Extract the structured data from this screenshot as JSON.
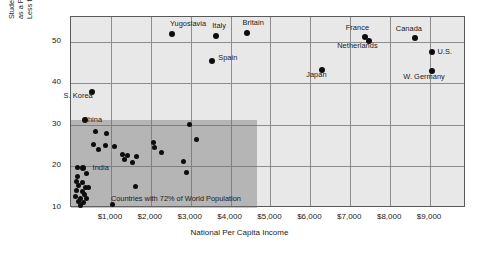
{
  "chart_data": {
    "type": "scatter",
    "title": "",
    "xlabel": "National Per Capita Income",
    "ylabel": "Students Enrolled in Secondary School as a Percentage of All Children Less that 15 Years Old",
    "ylabel_lines": [
      "Students Enrolled in Secondary School",
      "as a Percentage of All Children",
      "Less that 15 Years Old"
    ],
    "xlim": [
      0,
      9900
    ],
    "ylim": [
      10,
      56
    ],
    "xticks": [
      1000,
      2000,
      3000,
      4000,
      5000,
      6000,
      7000,
      8000,
      9000
    ],
    "xtick_labels": [
      "$1,000",
      "$2,000",
      "$3,000",
      "$4,000",
      "$5,000",
      "$6,000",
      "$7,000",
      "$8,000",
      "$9,000"
    ],
    "yticks": [
      10,
      20,
      30,
      40,
      50
    ],
    "ytick_labels": [
      "10",
      "20",
      "30",
      "40",
      "50"
    ],
    "grid": true,
    "legend": "none",
    "plot_bgcolor": "#e8e8e8",
    "point_color": "#0d0d0d",
    "shade_color": "rgba(110,110,110,0.42)",
    "annotations": [
      {
        "text": "Countries with 72% of World Population",
        "x": 1000,
        "y": 12.3
      }
    ],
    "shaded_region": {
      "label": "Countries with 72% of World Population",
      "x_range": [
        0,
        4650
      ],
      "y_range": [
        10,
        31.3
      ]
    },
    "labeled_points": [
      {
        "name": "Yugoslavia",
        "x": 2530,
        "y": 51.9,
        "label_dx": -2,
        "label_dy": -11
      },
      {
        "name": "Italy",
        "x": 3640,
        "y": 51.4,
        "label_dx": -4,
        "label_dy": -11
      },
      {
        "name": "Britain",
        "x": 4400,
        "y": 52.1,
        "label_dx": -4,
        "label_dy": -11
      },
      {
        "name": "Spain",
        "x": 3540,
        "y": 45.4,
        "label_dx": 6,
        "label_dy": -4
      },
      {
        "name": "S. Korea",
        "x": 530,
        "y": 38.0,
        "label_dx": -20,
        "label_dy": 3
      },
      {
        "name": "Japan",
        "x": 6300,
        "y": 43.2,
        "label_dx": -12,
        "label_dy": 4
      },
      {
        "name": "France",
        "x": 7380,
        "y": 51.3,
        "label_dx": -14,
        "label_dy": -10
      },
      {
        "name": "Netherlands",
        "x": 7480,
        "y": 50.2,
        "label_dx": -18,
        "label_dy": 4
      },
      {
        "name": "Canada",
        "x": 8620,
        "y": 51.0,
        "label_dx": -12,
        "label_dy": -10
      },
      {
        "name": "U.S.",
        "x": 9060,
        "y": 47.6,
        "label_dx": 5,
        "label_dy": -1
      },
      {
        "name": "W. Germany",
        "x": 9050,
        "y": 43.0,
        "label_dx": -14,
        "label_dy": 5
      },
      {
        "name": "China",
        "x": 340,
        "y": 31.3,
        "label_dx": -2,
        "label_dy": -1
      },
      {
        "name": "India",
        "x": 290,
        "y": 19.6,
        "label_dx": 10,
        "label_dy": -1
      }
    ],
    "unlabeled_points": [
      {
        "x": 620,
        "y": 28.4
      },
      {
        "x": 900,
        "y": 28.0
      },
      {
        "x": 560,
        "y": 25.2
      },
      {
        "x": 700,
        "y": 24.0
      },
      {
        "x": 860,
        "y": 25.0
      },
      {
        "x": 1080,
        "y": 24.9
      },
      {
        "x": 1290,
        "y": 23.0
      },
      {
        "x": 1410,
        "y": 22.6
      },
      {
        "x": 1350,
        "y": 21.6
      },
      {
        "x": 1640,
        "y": 22.4
      },
      {
        "x": 1550,
        "y": 21.0
      },
      {
        "x": 2080,
        "y": 25.8
      },
      {
        "x": 2090,
        "y": 24.5
      },
      {
        "x": 2270,
        "y": 23.4
      },
      {
        "x": 2980,
        "y": 30.0
      },
      {
        "x": 3150,
        "y": 26.4
      },
      {
        "x": 2820,
        "y": 21.2
      },
      {
        "x": 2900,
        "y": 18.6
      },
      {
        "x": 1620,
        "y": 15.2
      },
      {
        "x": 160,
        "y": 19.7
      },
      {
        "x": 170,
        "y": 17.7
      },
      {
        "x": 380,
        "y": 18.2
      },
      {
        "x": 140,
        "y": 16.5
      },
      {
        "x": 300,
        "y": 16.2
      },
      {
        "x": 200,
        "y": 15.5
      },
      {
        "x": 360,
        "y": 15.0
      },
      {
        "x": 430,
        "y": 15.0
      },
      {
        "x": 150,
        "y": 14.1
      },
      {
        "x": 280,
        "y": 14.0
      },
      {
        "x": 330,
        "y": 13.3
      },
      {
        "x": 120,
        "y": 12.7
      },
      {
        "x": 250,
        "y": 12.3
      },
      {
        "x": 400,
        "y": 12.4
      },
      {
        "x": 180,
        "y": 11.6
      },
      {
        "x": 310,
        "y": 11.3
      },
      {
        "x": 250,
        "y": 10.6
      },
      {
        "x": 1050,
        "y": 10.9
      }
    ]
  }
}
